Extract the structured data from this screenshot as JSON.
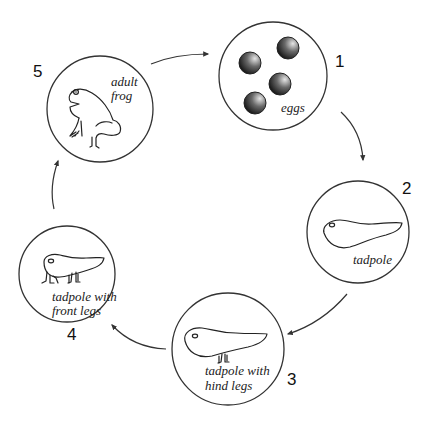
{
  "diagram": {
    "colors": {
      "line": "#333333",
      "egg_dark": "#1a1a1a",
      "egg_light": "#cfcfcf",
      "background": "#ffffff"
    },
    "stages": [
      {
        "number": "1",
        "label_lines": [
          "eggs"
        ],
        "icon": "frog-eggs-icon"
      },
      {
        "number": "2",
        "label_lines": [
          "tadpole"
        ],
        "icon": "tadpole-icon"
      },
      {
        "number": "3",
        "label_lines": [
          "tadpole with",
          "hind legs"
        ],
        "icon": "tadpole-hind-legs-icon"
      },
      {
        "number": "4",
        "label_lines": [
          "tadpole with",
          "front legs"
        ],
        "icon": "tadpole-front-legs-icon"
      },
      {
        "number": "5",
        "label_lines": [
          "adult",
          "frog"
        ],
        "icon": "adult-frog-icon"
      }
    ],
    "arrows": [
      {
        "from": "5",
        "to": "1"
      },
      {
        "from": "1",
        "to": "2"
      },
      {
        "from": "2",
        "to": "3"
      },
      {
        "from": "3",
        "to": "4"
      },
      {
        "from": "4",
        "to": "5"
      }
    ]
  }
}
